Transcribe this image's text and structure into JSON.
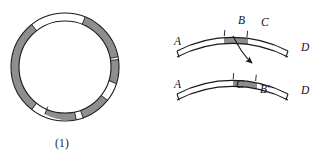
{
  "figure": {
    "panels": [
      {
        "id": "ring-panel",
        "caption": "(1)",
        "description": "annulus with alternating shaded and unshaded arc segments",
        "geometry": {
          "center_x": 65,
          "center_y": 67,
          "outer_radius": 54,
          "inner_radius": 46
        },
        "shaded_segments": [
          {
            "name": "upper-right-segment",
            "start_deg": 292,
            "end_deg": 348
          },
          {
            "name": "right-upper-segment",
            "start_deg": 352,
            "end_deg": 18
          },
          {
            "name": "left-long-segment",
            "start_deg": 128,
            "end_deg": 228
          },
          {
            "name": "bottom-left-segment",
            "start_deg": 78,
            "end_deg": 112
          },
          {
            "name": "bottom-right-segment",
            "start_deg": 38,
            "end_deg": 70
          }
        ]
      },
      {
        "id": "strips-panel",
        "caption": "(2)",
        "description": "two curved bands showing a segment translated from the upper band to the lower band",
        "upper_band": {
          "name": "upper-arc",
          "labels": [
            {
              "text": "A",
              "position": "left-end"
            },
            {
              "text": "B",
              "position": "top-left-of-segment"
            },
            {
              "text": "C",
              "position": "top-right-of-segment"
            },
            {
              "text": "D",
              "position": "right-end"
            }
          ]
        },
        "lower_band": {
          "name": "lower-arc",
          "labels": [
            {
              "text": "A",
              "position": "left-end"
            },
            {
              "text": "C",
              "position": "below-left-of-segment"
            },
            {
              "text": "B′",
              "position": "below-right-of-segment"
            },
            {
              "text": "D",
              "position": "right-end"
            }
          ]
        },
        "arrow": {
          "name": "transfer-arrow",
          "from": "upper band shaded segment",
          "to": "lower band shaded segment",
          "style": "curved with solid arrowhead"
        }
      }
    ],
    "colors": {
      "stroke": "#1a1a1a",
      "shaded_fill": "#8e8e8e",
      "unshaded_fill": "#ffffff",
      "background": "#ffffff",
      "label_text": "#111111"
    }
  },
  "labels": {
    "upper_A": "A",
    "upper_B": "B",
    "upper_C": "C",
    "upper_D": "D",
    "lower_A": "A",
    "lower_C": "C",
    "lower_Bprime": "B′",
    "lower_D": "D"
  },
  "captions": {
    "one": "(1)",
    "two": "(2)"
  }
}
